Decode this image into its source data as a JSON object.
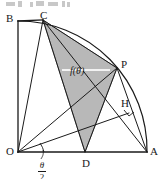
{
  "figure": {
    "type": "geometry-diagram",
    "canvas": {
      "width": 161,
      "height": 179
    },
    "colors": {
      "stroke": "#1a1a1a",
      "shade_fill": "#b8b8b8",
      "shade_stroke": "#555555",
      "guide": "#e8e8e8",
      "background": "#ffffff"
    },
    "center": {
      "name": "O",
      "x": 18,
      "y": 152
    },
    "radius": 129,
    "points": [
      {
        "name": "O",
        "label": "O",
        "x": 18,
        "y": 152,
        "label_x": 6,
        "label_y": 146
      },
      {
        "name": "A",
        "label": "A",
        "x": 147,
        "y": 152,
        "label_x": 150,
        "label_y": 146
      },
      {
        "name": "B",
        "label": "B",
        "x": 18,
        "y": 21,
        "label_x": 6,
        "label_y": 13
      },
      {
        "name": "C",
        "label": "C",
        "x": 43,
        "y": 20,
        "label_x": 40,
        "label_y": 10
      },
      {
        "name": "P",
        "label": "P",
        "x": 117,
        "y": 68,
        "label_x": 121,
        "label_y": 59
      },
      {
        "name": "H",
        "label": "H",
        "x": 129,
        "y": 113,
        "label_x": 121,
        "label_y": 98
      },
      {
        "name": "D",
        "label": "D",
        "x": 85,
        "y": 152,
        "label_x": 82,
        "label_y": 158
      }
    ],
    "shaded_region": {
      "name": "triangle-CPD",
      "vertices": [
        "C",
        "P",
        "D"
      ],
      "label": "f(θ)",
      "label_x": 70,
      "label_y": 66
    },
    "angle_mark": {
      "name": "angle-theta-over-two",
      "at": "O",
      "numerator": "θ",
      "denominator": "2",
      "label_x": 38,
      "label_y": 161
    },
    "right_angle_mark": {
      "name": "right-angle-at-foot",
      "x": 129,
      "y": 113
    },
    "segments": [
      {
        "name": "segment-OA",
        "from": "O",
        "to": "A"
      },
      {
        "name": "segment-OB",
        "from": "O",
        "to": "B"
      },
      {
        "name": "segment-BC",
        "from": "B",
        "to": "C"
      },
      {
        "name": "segment-OC",
        "from": "O",
        "to": "C"
      },
      {
        "name": "segment-OP",
        "from": "O",
        "to": "P"
      },
      {
        "name": "segment-OH",
        "from": "O",
        "to": "H"
      },
      {
        "name": "segment-CD",
        "from": "C",
        "to": "D"
      },
      {
        "name": "segment-CP",
        "from": "C",
        "to": "P"
      },
      {
        "name": "segment-PD",
        "from": "P",
        "to": "D"
      },
      {
        "name": "segment-PA",
        "from": "P",
        "to": "A"
      },
      {
        "name": "segment-CA",
        "from": "C",
        "to": "A"
      }
    ],
    "arc": {
      "name": "arc-BA",
      "from": "B",
      "to": "A"
    }
  }
}
